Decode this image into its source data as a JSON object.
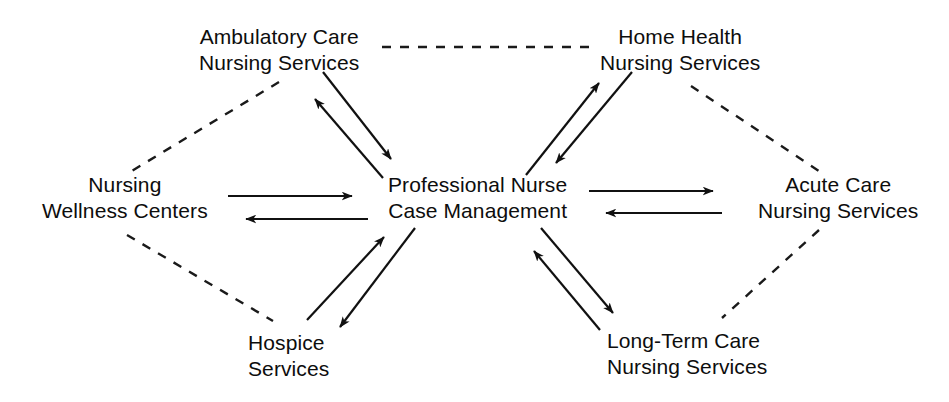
{
  "diagram": {
    "line_color": "#111111",
    "dashed_color": "#1a1a1a",
    "background": "#ffffff",
    "nodes": [
      {
        "id": "ambulatory",
        "name": "Ambulatory Care Nursing Services",
        "line1": "Ambulatory Care",
        "line2": "Nursing Services"
      },
      {
        "id": "home-health",
        "name": "Home Health Nursing Services",
        "line1": "Home Health",
        "line2": "Nursing Services"
      },
      {
        "id": "wellness",
        "name": "Nursing Wellness Centers",
        "line1": "Nursing",
        "line2": "Wellness Centers"
      },
      {
        "id": "center",
        "name": "Professional Nurse Case Management",
        "line1": "Professional Nurse",
        "line2": "Case Management"
      },
      {
        "id": "acute",
        "name": "Acute Care Nursing Services",
        "line1": "Acute Care",
        "line2": "Nursing Services"
      },
      {
        "id": "hospice",
        "name": "Hospice Services",
        "line1": "Hospice",
        "line2": "Services"
      },
      {
        "id": "longterm",
        "name": "Long-Term Care Nursing Services",
        "line1": "Long-Term Care",
        "line2": "Nursing Services"
      }
    ],
    "edges": [
      {
        "id": "center-ambulatory",
        "from": "center",
        "to": "ambulatory",
        "style": "solid",
        "direction": "bidirectional"
      },
      {
        "id": "center-home-health",
        "from": "center",
        "to": "home-health",
        "style": "solid",
        "direction": "bidirectional"
      },
      {
        "id": "center-wellness",
        "from": "center",
        "to": "wellness",
        "style": "solid",
        "direction": "bidirectional"
      },
      {
        "id": "center-acute",
        "from": "center",
        "to": "acute",
        "style": "solid",
        "direction": "bidirectional"
      },
      {
        "id": "center-hospice",
        "from": "center",
        "to": "hospice",
        "style": "solid",
        "direction": "bidirectional"
      },
      {
        "id": "center-longterm",
        "from": "center",
        "to": "longterm",
        "style": "solid",
        "direction": "bidirectional"
      },
      {
        "id": "ambulatory-home-health",
        "from": "ambulatory",
        "to": "home-health",
        "style": "dashed",
        "direction": "none"
      },
      {
        "id": "ambulatory-wellness",
        "from": "ambulatory",
        "to": "wellness",
        "style": "dashed",
        "direction": "none"
      },
      {
        "id": "wellness-hospice",
        "from": "wellness",
        "to": "hospice",
        "style": "dashed",
        "direction": "none"
      },
      {
        "id": "home-health-acute",
        "from": "home-health",
        "to": "acute",
        "style": "dashed",
        "direction": "none"
      },
      {
        "id": "acute-longterm",
        "from": "acute",
        "to": "longterm",
        "style": "dashed",
        "direction": "none"
      }
    ]
  }
}
